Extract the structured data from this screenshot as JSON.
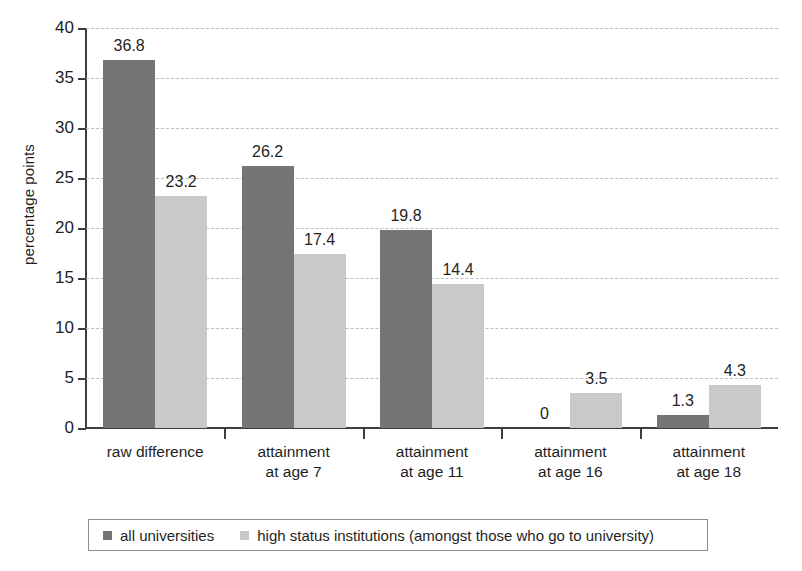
{
  "chart_data": {
    "type": "bar",
    "title": "",
    "xlabel": "",
    "ylabel": "percentage points",
    "ylim": [
      0,
      40
    ],
    "ytick_values": [
      0,
      5,
      10,
      15,
      20,
      25,
      30,
      35,
      40
    ],
    "ytick_labels": [
      "0",
      "5",
      "10",
      "15",
      "20",
      "25",
      "30",
      "35",
      "40"
    ],
    "grid": true,
    "legend_position": "bottom",
    "categories": [
      "raw difference",
      "attainment at age 7",
      "attainment at age 11",
      "attainment at age 16",
      "attainment at age 18"
    ],
    "category_lines": [
      [
        "raw difference"
      ],
      [
        "attainment",
        "at age 7"
      ],
      [
        "attainment",
        "at age 11"
      ],
      [
        "attainment",
        "at age 16"
      ],
      [
        "attainment",
        "at age 18"
      ]
    ],
    "series": [
      {
        "name": "all universities",
        "color": "#757575",
        "values": [
          36.8,
          26.2,
          19.8,
          0,
          1.3
        ],
        "labels": [
          "36.8",
          "26.2",
          "19.8",
          "0",
          "1.3"
        ]
      },
      {
        "name": "high status institutions (amongst those who go to university)",
        "color": "#c9c9c9",
        "values": [
          23.2,
          17.4,
          14.4,
          3.5,
          4.3
        ],
        "labels": [
          "23.2",
          "17.4",
          "14.4",
          "3.5",
          "4.3"
        ]
      }
    ]
  },
  "legend": {
    "items": [
      {
        "label": "all universities"
      },
      {
        "label": "high status institutions (amongst those who go to university)"
      }
    ]
  }
}
